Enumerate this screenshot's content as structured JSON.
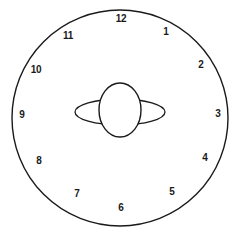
{
  "figure": {
    "name": "clock-face-drawing",
    "background_color": "#ffffff",
    "stroke_color": "#1a1a1a"
  },
  "dial": {
    "center_x": 120,
    "center_y": 118,
    "radius": 108,
    "stroke_width": 1.4
  },
  "hands": {
    "horizontal_ellipse": {
      "cx": 120,
      "cy": 112,
      "rx": 45,
      "ry": 13,
      "stroke_width": 1.3
    },
    "vertical_ellipse": {
      "cx": 120,
      "cy": 110,
      "rx": 21,
      "ry": 27,
      "stroke_width": 1.4
    }
  },
  "numerals": [
    {
      "label": "12",
      "x": 121,
      "y": 19,
      "name": "clock-numeral-12"
    },
    {
      "label": "1",
      "x": 166,
      "y": 32,
      "name": "clock-numeral-1"
    },
    {
      "label": "2",
      "x": 201,
      "y": 65,
      "name": "clock-numeral-2"
    },
    {
      "label": "3",
      "x": 218,
      "y": 114,
      "name": "clock-numeral-3"
    },
    {
      "label": "4",
      "x": 205,
      "y": 158,
      "name": "clock-numeral-4"
    },
    {
      "label": "5",
      "x": 172,
      "y": 192,
      "name": "clock-numeral-5"
    },
    {
      "label": "6",
      "x": 121,
      "y": 208,
      "name": "clock-numeral-6"
    },
    {
      "label": "7",
      "x": 77,
      "y": 194,
      "name": "clock-numeral-7"
    },
    {
      "label": "8",
      "x": 39,
      "y": 161,
      "name": "clock-numeral-8"
    },
    {
      "label": "9",
      "x": 22,
      "y": 115,
      "name": "clock-numeral-9"
    },
    {
      "label": "10",
      "x": 36,
      "y": 70,
      "name": "clock-numeral-10"
    },
    {
      "label": "11",
      "x": 68,
      "y": 36,
      "name": "clock-numeral-11"
    }
  ]
}
